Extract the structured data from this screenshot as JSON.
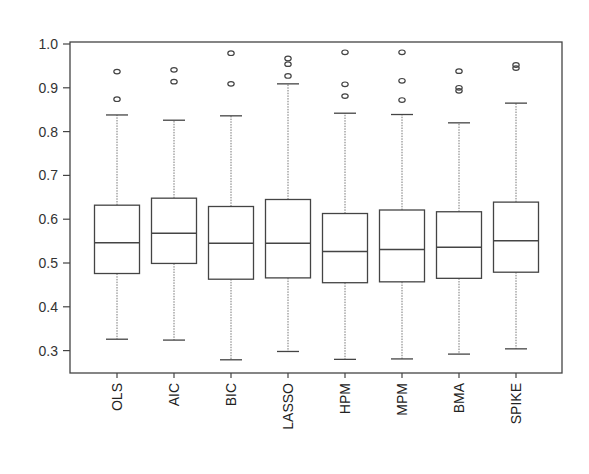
{
  "chart_data": {
    "type": "boxplot",
    "title": "",
    "xlabel": "",
    "ylabel": "",
    "ylim": [
      0.25,
      1.0
    ],
    "yticks": [
      0.3,
      0.4,
      0.5,
      0.6,
      0.7,
      0.8,
      0.9,
      1.0
    ],
    "ytick_labels": [
      "0.3",
      "0.4",
      "0.5",
      "0.6",
      "0.7",
      "0.8",
      "0.9",
      "1.0"
    ],
    "grid": false,
    "legend": null,
    "categories": [
      "OLS",
      "AIC",
      "BIC",
      "LASSO",
      "HPM",
      "MPM",
      "BMA",
      "SPIKE"
    ],
    "boxes": [
      {
        "name": "OLS",
        "whisker_low": 0.326,
        "q1": 0.476,
        "median": 0.546,
        "q3": 0.632,
        "whisker_high": 0.838,
        "outliers": [
          0.874,
          0.937
        ]
      },
      {
        "name": "AIC",
        "whisker_low": 0.324,
        "q1": 0.499,
        "median": 0.568,
        "q3": 0.648,
        "whisker_high": 0.826,
        "outliers": [
          0.914,
          0.941
        ]
      },
      {
        "name": "BIC",
        "whisker_low": 0.279,
        "q1": 0.463,
        "median": 0.545,
        "q3": 0.629,
        "whisker_high": 0.836,
        "outliers": [
          0.909,
          0.979
        ]
      },
      {
        "name": "LASSO",
        "whisker_low": 0.298,
        "q1": 0.466,
        "median": 0.545,
        "q3": 0.645,
        "whisker_high": 0.909,
        "outliers": [
          0.927,
          0.954,
          0.967
        ]
      },
      {
        "name": "HPM",
        "whisker_low": 0.28,
        "q1": 0.455,
        "median": 0.526,
        "q3": 0.613,
        "whisker_high": 0.842,
        "outliers": [
          0.881,
          0.908,
          0.981
        ]
      },
      {
        "name": "MPM",
        "whisker_low": 0.281,
        "q1": 0.457,
        "median": 0.531,
        "q3": 0.621,
        "whisker_high": 0.839,
        "outliers": [
          0.872,
          0.916,
          0.981
        ]
      },
      {
        "name": "BMA",
        "whisker_low": 0.292,
        "q1": 0.465,
        "median": 0.536,
        "q3": 0.617,
        "whisker_high": 0.82,
        "outliers": [
          0.893,
          0.9,
          0.938
        ]
      },
      {
        "name": "SPIKE",
        "whisker_low": 0.304,
        "q1": 0.479,
        "median": 0.551,
        "q3": 0.639,
        "whisker_high": 0.865,
        "outliers": [
          0.945,
          0.952
        ]
      }
    ]
  },
  "style": {
    "line_color": "#444444",
    "whisker_color": "#777777",
    "background": "#ffffff"
  }
}
